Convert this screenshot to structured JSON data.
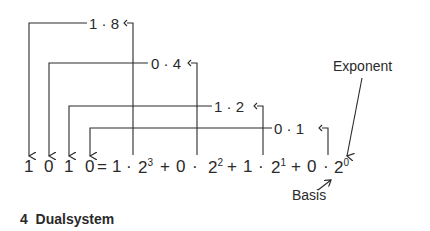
{
  "diagram": {
    "binary_digits": [
      "1",
      "0",
      "1",
      "0"
    ],
    "equals": "=",
    "terms": [
      {
        "coef": "1",
        "dot": "·",
        "base": "2",
        "exp": "3"
      },
      {
        "coef": "0",
        "dot": "·",
        "base": "2",
        "exp": "2"
      },
      {
        "coef": "1",
        "dot": "·",
        "base": "2",
        "exp": "1"
      },
      {
        "coef": "0",
        "dot": "·",
        "base": "2",
        "exp": "0"
      }
    ],
    "plus": "+",
    "products": [
      {
        "label": "1 · 8"
      },
      {
        "label": "0 · 4"
      },
      {
        "label": "1 · 2"
      },
      {
        "label": "0 · 1"
      }
    ],
    "annotations": {
      "exponent": "Exponent",
      "basis": "Basis"
    },
    "caption": "4  Dualsystem",
    "colors": {
      "ink": "#2a2a2a",
      "background": "#ffffff"
    }
  }
}
